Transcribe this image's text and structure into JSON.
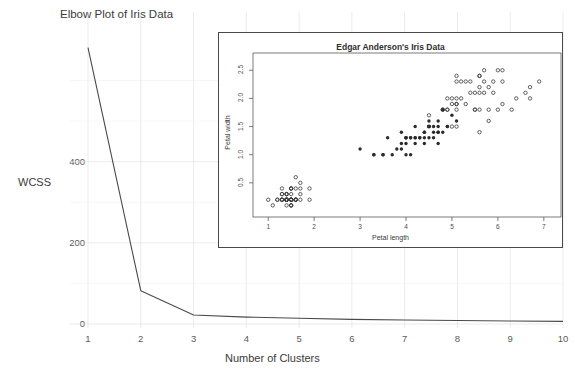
{
  "chart_data": [
    {
      "id": "elbow",
      "type": "line",
      "title": "Elbow Plot of Iris Data",
      "xlabel": "Number of Clusters",
      "ylabel": "WCSS",
      "x": [
        1,
        2,
        3,
        4,
        5,
        6,
        7,
        8,
        9,
        10
      ],
      "values": [
        681.0,
        82.0,
        22.0,
        17.0,
        14.0,
        11.5,
        10.0,
        8.5,
        7.5,
        6.5
      ],
      "xticks": [
        "1",
        "2",
        "3",
        "4",
        "5",
        "6",
        "7",
        "8",
        "9",
        "10"
      ],
      "yticks": [
        "0",
        "200",
        "400"
      ],
      "ytick_values": [
        0,
        200,
        400
      ],
      "xlim": [
        1,
        10
      ],
      "ylim": [
        0,
        700
      ],
      "grid": true,
      "line_color": "#4a4a4a",
      "grid_color": "#dedede"
    },
    {
      "id": "iris-scatter",
      "type": "scatter",
      "title": "Edgar Anderson's Iris Data",
      "xlabel": "Petal length",
      "ylabel": "Petal width",
      "xticks": [
        "1",
        "2",
        "3",
        "4",
        "5",
        "6",
        "7"
      ],
      "yticks": [
        "0.5",
        "1.0",
        "1.5",
        "2.0",
        "2.5"
      ],
      "xlim": [
        0.8,
        7.2
      ],
      "ylim": [
        0.0,
        2.7
      ],
      "grid": false,
      "marker_open_color": "#3a3a3a",
      "marker_filled_color": "#2b2b2b",
      "series": [
        {
          "name": "open-markers",
          "marker": "open-circle",
          "points": [
            [
              1.4,
              0.2
            ],
            [
              1.4,
              0.2
            ],
            [
              1.3,
              0.2
            ],
            [
              1.5,
              0.2
            ],
            [
              1.4,
              0.2
            ],
            [
              1.7,
              0.4
            ],
            [
              1.4,
              0.3
            ],
            [
              1.5,
              0.2
            ],
            [
              1.4,
              0.2
            ],
            [
              1.5,
              0.1
            ],
            [
              1.5,
              0.2
            ],
            [
              1.6,
              0.2
            ],
            [
              1.4,
              0.1
            ],
            [
              1.1,
              0.1
            ],
            [
              1.2,
              0.2
            ],
            [
              1.5,
              0.4
            ],
            [
              1.3,
              0.4
            ],
            [
              1.4,
              0.3
            ],
            [
              1.7,
              0.3
            ],
            [
              1.5,
              0.3
            ],
            [
              1.7,
              0.2
            ],
            [
              1.5,
              0.4
            ],
            [
              1.0,
              0.2
            ],
            [
              1.7,
              0.5
            ],
            [
              1.9,
              0.2
            ],
            [
              1.6,
              0.2
            ],
            [
              1.6,
              0.4
            ],
            [
              1.5,
              0.2
            ],
            [
              1.4,
              0.2
            ],
            [
              1.6,
              0.2
            ],
            [
              1.6,
              0.2
            ],
            [
              1.5,
              0.4
            ],
            [
              1.5,
              0.1
            ],
            [
              1.4,
              0.2
            ],
            [
              1.5,
              0.2
            ],
            [
              1.2,
              0.2
            ],
            [
              1.3,
              0.2
            ],
            [
              1.5,
              0.1
            ],
            [
              1.3,
              0.2
            ],
            [
              1.5,
              0.2
            ],
            [
              1.3,
              0.3
            ],
            [
              1.3,
              0.3
            ],
            [
              1.3,
              0.2
            ],
            [
              1.6,
              0.6
            ],
            [
              1.9,
              0.4
            ],
            [
              1.4,
              0.3
            ],
            [
              1.6,
              0.2
            ],
            [
              1.4,
              0.2
            ],
            [
              1.5,
              0.2
            ],
            [
              1.4,
              0.2
            ],
            [
              6.0,
              2.5
            ],
            [
              5.1,
              1.9
            ],
            [
              5.9,
              2.1
            ],
            [
              5.6,
              1.8
            ],
            [
              5.8,
              2.2
            ],
            [
              6.6,
              2.1
            ],
            [
              4.5,
              1.7
            ],
            [
              6.3,
              1.8
            ],
            [
              5.8,
              1.8
            ],
            [
              6.1,
              2.5
            ],
            [
              5.1,
              2.0
            ],
            [
              5.3,
              1.9
            ],
            [
              5.5,
              2.1
            ],
            [
              5.0,
              2.0
            ],
            [
              5.1,
              2.4
            ],
            [
              5.3,
              2.3
            ],
            [
              5.5,
              1.8
            ],
            [
              6.7,
              2.2
            ],
            [
              6.9,
              2.3
            ],
            [
              5.0,
              1.5
            ],
            [
              5.7,
              2.3
            ],
            [
              4.9,
              2.0
            ],
            [
              6.7,
              2.0
            ],
            [
              4.9,
              1.8
            ],
            [
              5.7,
              2.1
            ],
            [
              6.0,
              1.8
            ],
            [
              4.8,
              1.8
            ],
            [
              4.9,
              1.8
            ],
            [
              5.6,
              2.1
            ],
            [
              5.8,
              1.6
            ],
            [
              6.1,
              1.9
            ],
            [
              6.4,
              2.0
            ],
            [
              5.6,
              2.2
            ],
            [
              5.1,
              1.5
            ],
            [
              5.6,
              1.4
            ],
            [
              6.1,
              2.3
            ],
            [
              5.6,
              2.4
            ],
            [
              5.5,
              1.8
            ],
            [
              4.8,
              1.8
            ],
            [
              5.4,
              2.1
            ],
            [
              5.6,
              2.4
            ],
            [
              5.1,
              2.3
            ],
            [
              5.1,
              1.9
            ],
            [
              5.9,
              2.3
            ],
            [
              5.7,
              2.5
            ],
            [
              5.2,
              2.3
            ],
            [
              5.0,
              1.9
            ],
            [
              5.2,
              2.0
            ],
            [
              5.4,
              2.3
            ],
            [
              5.1,
              1.8
            ]
          ]
        },
        {
          "name": "filled-markers",
          "marker": "filled-circle",
          "points": [
            [
              4.7,
              1.4
            ],
            [
              4.5,
              1.5
            ],
            [
              4.9,
              1.5
            ],
            [
              4.0,
              1.3
            ],
            [
              4.6,
              1.5
            ],
            [
              4.5,
              1.3
            ],
            [
              4.7,
              1.6
            ],
            [
              3.3,
              1.0
            ],
            [
              4.6,
              1.3
            ],
            [
              3.9,
              1.4
            ],
            [
              3.5,
              1.0
            ],
            [
              4.2,
              1.5
            ],
            [
              4.0,
              1.0
            ],
            [
              4.7,
              1.4
            ],
            [
              3.6,
              1.3
            ],
            [
              4.4,
              1.4
            ],
            [
              4.5,
              1.5
            ],
            [
              4.1,
              1.0
            ],
            [
              4.5,
              1.5
            ],
            [
              3.9,
              1.1
            ],
            [
              4.8,
              1.8
            ],
            [
              4.0,
              1.3
            ],
            [
              4.9,
              1.5
            ],
            [
              4.7,
              1.2
            ],
            [
              4.3,
              1.3
            ],
            [
              4.4,
              1.4
            ],
            [
              4.8,
              1.4
            ],
            [
              5.0,
              1.7
            ],
            [
              4.5,
              1.5
            ],
            [
              3.5,
              1.0
            ],
            [
              3.8,
              1.1
            ],
            [
              3.7,
              1.0
            ],
            [
              3.9,
              1.2
            ],
            [
              5.1,
              1.6
            ],
            [
              4.5,
              1.5
            ],
            [
              4.5,
              1.6
            ],
            [
              4.7,
              1.5
            ],
            [
              4.4,
              1.3
            ],
            [
              4.1,
              1.3
            ],
            [
              4.0,
              1.3
            ],
            [
              4.4,
              1.2
            ],
            [
              4.6,
              1.4
            ],
            [
              4.0,
              1.2
            ],
            [
              3.3,
              1.0
            ],
            [
              4.2,
              1.3
            ],
            [
              4.2,
              1.2
            ],
            [
              4.2,
              1.3
            ],
            [
              4.3,
              1.3
            ],
            [
              3.0,
              1.1
            ],
            [
              4.1,
              1.3
            ]
          ]
        }
      ]
    }
  ]
}
